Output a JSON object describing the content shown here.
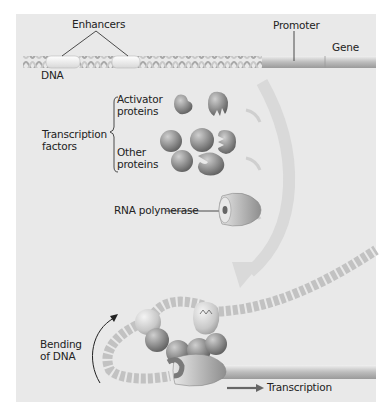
{
  "diagram": {
    "type": "biology-schematic",
    "colors": {
      "background": "#ffffff",
      "panel": "#e9e9e9",
      "dna": "#c4c4c4",
      "protein": "#8a8a8a",
      "arrow": "#d6d6d6",
      "text": "#222222"
    },
    "labels": {
      "enhancers": "Enhancers",
      "promoter": "Promoter",
      "gene": "Gene",
      "dna": "DNA",
      "transcription_factors_line1": "Transcription",
      "transcription_factors_line2": "factors",
      "activator_line1": "Activator",
      "activator_line2": "proteins",
      "other_line1": "Other",
      "other_line2": "proteins",
      "rna_polymerase": "RNA polymerase",
      "bending_line1": "Bending",
      "bending_line2": "of DNA",
      "transcription": "Transcription"
    }
  }
}
